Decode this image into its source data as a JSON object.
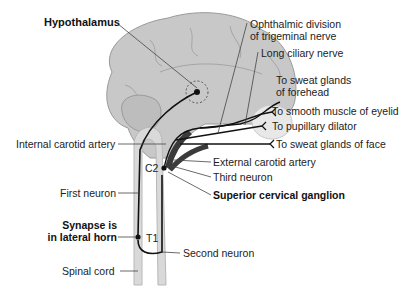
{
  "diagram": {
    "colors": {
      "brain": "#c8c8c8",
      "brain_outline": "#9a9a9a",
      "spinal_cord": "#d9d9d9",
      "nerve": "#111111",
      "artery": "#3a3a3a",
      "eye": "#e6e6e6"
    },
    "labels": {
      "hypothalamus": "Hypothalamus",
      "ophthalmic_1": "Ophthalmic division",
      "ophthalmic_2": "of trigeminal nerve",
      "long_ciliary": "Long ciliary nerve",
      "sweat_forehead_1": "To sweat glands",
      "sweat_forehead_2": "of forehead",
      "smooth_muscle": "To smooth muscle of eyelid",
      "pupillary": "To pupillary dilator",
      "sweat_face": "To sweat glands of face",
      "internal_carotid": "Internal carotid artery",
      "external_carotid": "External carotid artery",
      "c2": "C2",
      "third_neuron": "Third neuron",
      "superior_cervical": "Superior cervical ganglion",
      "first_neuron": "First neuron",
      "synapse_1": "Synapse is",
      "synapse_2": "in lateral horn",
      "t1": "T1",
      "second_neuron": "Second neuron",
      "spinal_cord": "Spinal cord"
    }
  }
}
